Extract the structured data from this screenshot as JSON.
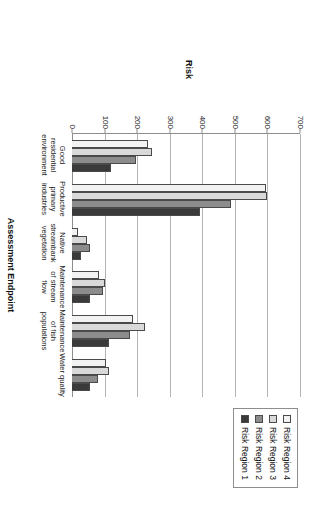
{
  "chart_data": {
    "type": "bar",
    "title": "",
    "xlabel": "Assessment Endpoint",
    "ylabel": "Risk",
    "orientation": "vertical",
    "grid": true,
    "legend_position": "top-right",
    "ylim": [
      0,
      700
    ],
    "yticks": [
      0,
      100,
      200,
      300,
      400,
      500,
      600,
      700
    ],
    "ytick_labels": [
      "0",
      "100",
      "200",
      "300",
      "400",
      "500",
      "600",
      "700"
    ],
    "categories": [
      "Good residential environment",
      "Productive primary industries",
      "Native streambank vegetation",
      "Maintenance of stream flow",
      "Maintenance of fish populations",
      "Water quality"
    ],
    "series": [
      {
        "name": "Risk Region 4",
        "color": "#f2f2f2",
        "values": [
          233,
          596,
          18,
          83,
          187,
          104
        ]
      },
      {
        "name": "Risk Region 3",
        "color": "#d9d9d9",
        "values": [
          246,
          598,
          45,
          102,
          225,
          115
        ]
      },
      {
        "name": "Risk Region 2",
        "color": "#8c8c8c",
        "values": [
          198,
          487,
          56,
          94,
          179,
          80
        ]
      },
      {
        "name": "Risk Region 1",
        "color": "#3a3a3a",
        "values": [
          120,
          393,
          27,
          56,
          115,
          56
        ]
      }
    ]
  },
  "axes": {
    "value_axis_title": "Risk",
    "category_axis_title": "Assessment Endpoint"
  },
  "legend": {
    "items": [
      {
        "label": "Risk Region 4",
        "color": "#f2f2f2"
      },
      {
        "label": "Risk Region 3",
        "color": "#d9d9d9"
      },
      {
        "label": "Risk Region 2",
        "color": "#8c8c8c"
      },
      {
        "label": "Risk Region 1",
        "color": "#3a3a3a"
      }
    ]
  },
  "colors": {
    "gridline": "#b4b4b4",
    "axis": "#8d8d8d",
    "bar_outline": "#4a4a4a",
    "background": "#ffffff"
  }
}
